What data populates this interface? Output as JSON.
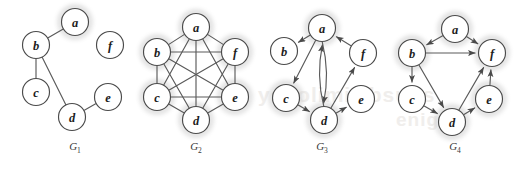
{
  "figure": {
    "background_color": "#ffffff",
    "node_fill": "#ffffff",
    "node_stroke": "#4a4a4a",
    "edge_color": "#5a5a5a",
    "label_color": "#1c1c1c",
    "highlight_color": "#c9c9c9",
    "watermark_color": "#f0eeec",
    "node_radius": 13.5,
    "watermark_text": "ysgolimiT ebsuqs"
  },
  "graphs": [
    {
      "id": "G1",
      "caption": "G",
      "caption_sub": "1",
      "directed": false,
      "nodes": [
        {
          "id": "a",
          "label": "a",
          "x": 75,
          "y": 22,
          "highlight": true
        },
        {
          "id": "b",
          "label": "b",
          "x": 36,
          "y": 45,
          "highlight": false
        },
        {
          "id": "c",
          "label": "c",
          "x": 36,
          "y": 92,
          "highlight": false
        },
        {
          "id": "d",
          "label": "d",
          "x": 72,
          "y": 117,
          "highlight": false
        },
        {
          "id": "e",
          "label": "e",
          "x": 108,
          "y": 97,
          "highlight": false
        },
        {
          "id": "f",
          "label": "f",
          "x": 110,
          "y": 45,
          "highlight": false
        }
      ],
      "edges": [
        {
          "from": "a",
          "to": "b",
          "arrow": false
        },
        {
          "from": "b",
          "to": "c",
          "arrow": false
        },
        {
          "from": "b",
          "to": "d",
          "arrow": false
        },
        {
          "from": "d",
          "to": "e",
          "arrow": false
        }
      ],
      "caption_x": 75,
      "caption_y": 151
    },
    {
      "id": "G2",
      "caption": "G",
      "caption_sub": "2",
      "directed": false,
      "nodes": [
        {
          "id": "a",
          "label": "a",
          "x": 196,
          "y": 27,
          "highlight": true
        },
        {
          "id": "b",
          "label": "b",
          "x": 157,
          "y": 52,
          "highlight": true
        },
        {
          "id": "c",
          "label": "c",
          "x": 157,
          "y": 97,
          "highlight": true
        },
        {
          "id": "d",
          "label": "d",
          "x": 196,
          "y": 120,
          "highlight": true
        },
        {
          "id": "e",
          "label": "e",
          "x": 235,
          "y": 97,
          "highlight": true
        },
        {
          "id": "f",
          "label": "f",
          "x": 235,
          "y": 52,
          "highlight": true
        }
      ],
      "edges": [
        {
          "from": "a",
          "to": "b",
          "arrow": false
        },
        {
          "from": "a",
          "to": "c",
          "arrow": false
        },
        {
          "from": "a",
          "to": "d",
          "arrow": false
        },
        {
          "from": "a",
          "to": "e",
          "arrow": false
        },
        {
          "from": "a",
          "to": "f",
          "arrow": false
        },
        {
          "from": "b",
          "to": "c",
          "arrow": false
        },
        {
          "from": "b",
          "to": "d",
          "arrow": false
        },
        {
          "from": "b",
          "to": "e",
          "arrow": false
        },
        {
          "from": "b",
          "to": "f",
          "arrow": false
        },
        {
          "from": "c",
          "to": "d",
          "arrow": false
        },
        {
          "from": "c",
          "to": "e",
          "arrow": false
        },
        {
          "from": "c",
          "to": "f",
          "arrow": false
        },
        {
          "from": "d",
          "to": "e",
          "arrow": false
        },
        {
          "from": "d",
          "to": "f",
          "arrow": false
        },
        {
          "from": "e",
          "to": "f",
          "arrow": false
        }
      ],
      "caption_x": 196,
      "caption_y": 151
    },
    {
      "id": "G3",
      "caption": "G",
      "caption_sub": "3",
      "directed": true,
      "nodes": [
        {
          "id": "a",
          "label": "a",
          "x": 322,
          "y": 28,
          "highlight": true
        },
        {
          "id": "b",
          "label": "b",
          "x": 284,
          "y": 51,
          "highlight": false
        },
        {
          "id": "c",
          "label": "c",
          "x": 286,
          "y": 98,
          "highlight": true
        },
        {
          "id": "d",
          "label": "d",
          "x": 324,
          "y": 120,
          "highlight": true
        },
        {
          "id": "e",
          "label": "e",
          "x": 361,
          "y": 99,
          "highlight": false
        },
        {
          "id": "f",
          "label": "f",
          "x": 363,
          "y": 53,
          "highlight": false
        }
      ],
      "edges": [
        {
          "from": "a",
          "to": "b",
          "arrow": true,
          "curve": 0
        },
        {
          "from": "a",
          "to": "c",
          "arrow": true,
          "curve": 0
        },
        {
          "from": "a",
          "to": "d",
          "arrow": true,
          "curve": -7
        },
        {
          "from": "d",
          "to": "a",
          "arrow": true,
          "curve": -7
        },
        {
          "from": "c",
          "to": "d",
          "arrow": true,
          "curve": 0
        },
        {
          "from": "d",
          "to": "e",
          "arrow": true,
          "curve": 0
        },
        {
          "from": "d",
          "to": "f",
          "arrow": true,
          "curve": 0
        },
        {
          "from": "f",
          "to": "a",
          "arrow": true,
          "curve": 0
        }
      ],
      "caption_x": 322,
      "caption_y": 151
    },
    {
      "id": "G4",
      "caption": "G",
      "caption_sub": "4",
      "directed": true,
      "nodes": [
        {
          "id": "a",
          "label": "a",
          "x": 455,
          "y": 29,
          "highlight": true
        },
        {
          "id": "b",
          "label": "b",
          "x": 412,
          "y": 53,
          "highlight": true
        },
        {
          "id": "c",
          "label": "c",
          "x": 412,
          "y": 99,
          "highlight": false
        },
        {
          "id": "d",
          "label": "d",
          "x": 452,
          "y": 122,
          "highlight": true
        },
        {
          "id": "e",
          "label": "e",
          "x": 489,
          "y": 99,
          "highlight": true
        },
        {
          "id": "f",
          "label": "f",
          "x": 492,
          "y": 53,
          "highlight": true
        }
      ],
      "edges": [
        {
          "from": "a",
          "to": "b",
          "arrow": true,
          "curve": 0
        },
        {
          "from": "a",
          "to": "f",
          "arrow": true,
          "curve": 0
        },
        {
          "from": "b",
          "to": "c",
          "arrow": true,
          "curve": 0
        },
        {
          "from": "b",
          "to": "d",
          "arrow": true,
          "curve": 0
        },
        {
          "from": "b",
          "to": "f",
          "arrow": true,
          "curve": 0
        },
        {
          "from": "c",
          "to": "d",
          "arrow": true,
          "curve": 0
        },
        {
          "from": "d",
          "to": "e",
          "arrow": true,
          "curve": 0
        },
        {
          "from": "d",
          "to": "f",
          "arrow": true,
          "curve": 0
        },
        {
          "from": "e",
          "to": "f",
          "arrow": true,
          "curve": 0
        }
      ],
      "caption_x": 455,
      "caption_y": 151
    }
  ],
  "watermarks": [
    {
      "text": "ysgolimiT",
      "x": 258,
      "y": 104,
      "size": 21,
      "rotate": 0
    },
    {
      "text": "ebsuqs",
      "x": 356,
      "y": 104,
      "size": 21,
      "rotate": 0
    },
    {
      "text": "enigne",
      "x": 396,
      "y": 128,
      "size": 19,
      "rotate": 0
    }
  ]
}
